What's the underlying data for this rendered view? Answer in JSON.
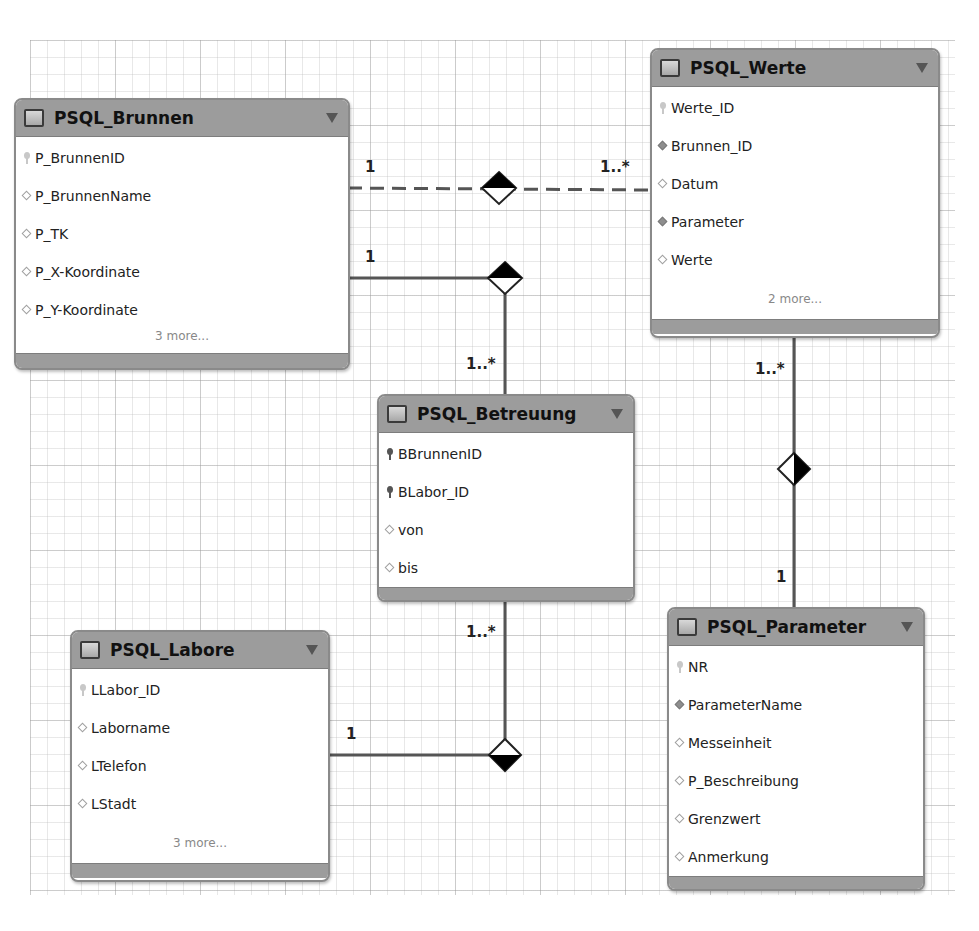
{
  "diagram": {
    "tables": {
      "brunnen": {
        "name": "PSQL_Brunnen",
        "columns": [
          {
            "name": "P_BrunnenID",
            "icon": "primary-key-icon"
          },
          {
            "name": "P_BrunnenName",
            "icon": "column-icon"
          },
          {
            "name": "P_TK",
            "icon": "column-icon"
          },
          {
            "name": "P_X-Koordinate",
            "icon": "column-icon"
          },
          {
            "name": "P_Y-Koordinate",
            "icon": "column-icon"
          }
        ],
        "more": "3 more..."
      },
      "werte": {
        "name": "PSQL_Werte",
        "columns": [
          {
            "name": "Werte_ID",
            "icon": "primary-key-icon"
          },
          {
            "name": "Brunnen_ID",
            "icon": "foreign-key-icon"
          },
          {
            "name": "Datum",
            "icon": "column-icon"
          },
          {
            "name": "Parameter",
            "icon": "foreign-key-icon"
          },
          {
            "name": "Werte",
            "icon": "column-icon"
          }
        ],
        "more": "2 more..."
      },
      "betreuung": {
        "name": "PSQL_Betreuung",
        "columns": [
          {
            "name": "BBrunnenID",
            "icon": "primary-key-icon"
          },
          {
            "name": "BLabor_ID",
            "icon": "primary-key-icon"
          },
          {
            "name": "von",
            "icon": "column-icon"
          },
          {
            "name": "bis",
            "icon": "column-icon"
          }
        ]
      },
      "labore": {
        "name": "PSQL_Labore",
        "columns": [
          {
            "name": "LLabor_ID",
            "icon": "primary-key-icon"
          },
          {
            "name": "Laborname",
            "icon": "column-icon"
          },
          {
            "name": "LTelefon",
            "icon": "column-icon"
          },
          {
            "name": "LStadt",
            "icon": "column-icon"
          }
        ],
        "more": "3 more..."
      },
      "parameter": {
        "name": "PSQL_Parameter",
        "columns": [
          {
            "name": "NR",
            "icon": "primary-key-icon"
          },
          {
            "name": "ParameterName",
            "icon": "foreign-key-icon"
          },
          {
            "name": "Messeinheit",
            "icon": "column-icon"
          },
          {
            "name": "P_Beschreibung",
            "icon": "column-icon"
          },
          {
            "name": "Grenzwert",
            "icon": "column-icon"
          },
          {
            "name": "Anmerkung",
            "icon": "column-icon"
          }
        ]
      }
    },
    "relationships": [
      {
        "from": "PSQL_Brunnen",
        "to": "PSQL_Werte",
        "style": "dashed",
        "from_card": "1",
        "to_card": "1..*"
      },
      {
        "from": "PSQL_Brunnen",
        "to": "PSQL_Betreuung",
        "style": "solid",
        "from_card": "1",
        "to_card": "1..*"
      },
      {
        "from": "PSQL_Labore",
        "to": "PSQL_Betreuung",
        "style": "solid",
        "from_card": "1",
        "to_card": "1..*"
      },
      {
        "from": "PSQL_Parameter",
        "to": "PSQL_Werte",
        "style": "solid",
        "from_card": "1",
        "to_card": "1..*"
      }
    ],
    "colors": {
      "header": "#9c9c9c",
      "border": "#8a8a8a",
      "line": "#555555"
    }
  }
}
